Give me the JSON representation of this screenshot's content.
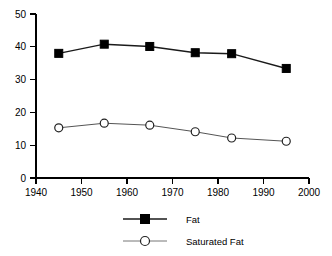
{
  "chart_data": {
    "type": "line",
    "title": "",
    "subtitle": "",
    "xlabel": "",
    "ylabel": "",
    "xlim": [
      1940,
      2000
    ],
    "ylim": [
      0,
      50
    ],
    "xticks": [
      1940,
      1950,
      1960,
      1970,
      1980,
      1990,
      2000
    ],
    "yticks": [
      0,
      10,
      20,
      30,
      40,
      50
    ],
    "xtick_labels": [
      "1940",
      "1950",
      "1960",
      "1970",
      "1980",
      "1990",
      "2000"
    ],
    "ytick_labels": [
      "0",
      "10",
      "20",
      "30",
      "40",
      "50"
    ],
    "grid": false,
    "legend_position": "bottom-center",
    "x": [
      1945,
      1955,
      1965,
      1975,
      1983,
      1995
    ],
    "series": [
      {
        "name": "Fat",
        "marker": "filled-square",
        "color": "#000000",
        "values": [
          38.0,
          40.8,
          40.1,
          38.2,
          37.9,
          33.4
        ]
      },
      {
        "name": "Saturated Fat",
        "marker": "open-circle",
        "color": "#555555",
        "values": [
          15.3,
          16.7,
          16.1,
          14.1,
          12.2,
          11.2
        ]
      }
    ]
  },
  "legend": {
    "entries": [
      {
        "label": "Fat"
      },
      {
        "label": "Saturated Fat"
      }
    ]
  }
}
